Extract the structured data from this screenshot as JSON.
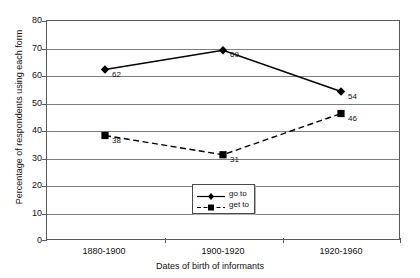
{
  "chart_data": {
    "type": "line",
    "title": "",
    "xlabel": "Dates of birth of informants",
    "ylabel": "Percentage of respondents using each form",
    "categories": [
      "1880-1900",
      "1900-1920",
      "1920-1960"
    ],
    "yticks": [
      0,
      10,
      20,
      30,
      40,
      50,
      60,
      70,
      80
    ],
    "ylim": [
      0,
      80
    ],
    "grid": true,
    "legend_position": "inside-bottom-center",
    "series": [
      {
        "name": "go to",
        "values": [
          62,
          69,
          54
        ],
        "marker": "diamond",
        "line_style": "solid",
        "color": "#000000",
        "point_labels": [
          "62",
          "69",
          "54"
        ]
      },
      {
        "name": "get to",
        "values": [
          38,
          31,
          46
        ],
        "marker": "square",
        "line_style": "dashed",
        "color": "#000000",
        "point_labels": [
          "38",
          "31",
          "46"
        ]
      }
    ]
  },
  "axis": {
    "y_tick_labels": [
      "80",
      "70",
      "60",
      "50",
      "40",
      "30",
      "20",
      "10",
      "0"
    ]
  },
  "legend": {
    "items": [
      {
        "label": "go to"
      },
      {
        "label": "get to"
      }
    ]
  }
}
